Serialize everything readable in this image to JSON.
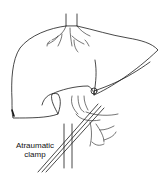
{
  "figure": {
    "labels": {
      "clamp_line1": "Atraumatic",
      "clamp_line2": "clamp"
    },
    "colors": {
      "line": "#1a1a1a",
      "background": "#ffffff"
    }
  }
}
